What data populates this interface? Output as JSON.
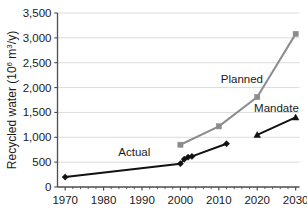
{
  "chart_data": {
    "type": "line",
    "title": "",
    "xlabel": "",
    "ylabel": "Recycled water (10⁶ m³/y)",
    "ylabel_main": "Recycled water (10",
    "ylabel_exp1": "6",
    "ylabel_mid": " m",
    "ylabel_exp2": "3",
    "ylabel_tail": "/y)",
    "xlim": [
      1968,
      2031
    ],
    "ylim": [
      0,
      3500
    ],
    "grid": true,
    "grid_axis": "y",
    "legend_position": "inline-annotations",
    "x_ticks": [
      1970,
      1980,
      1990,
      2000,
      2010,
      2020,
      2030
    ],
    "x_tick_labels": [
      "1970",
      "1980",
      "1990",
      "2000",
      "2010",
      "2020",
      "2030"
    ],
    "x_minor_tick_interval": 2,
    "y_ticks": [
      0,
      500,
      1000,
      1500,
      2000,
      2500,
      3000,
      3500
    ],
    "y_tick_labels": [
      "0",
      "500",
      "1,000",
      "1,500",
      "2,000",
      "2,500",
      "3,000",
      "3,500"
    ],
    "series": [
      {
        "name": "Actual",
        "color": "#111111",
        "marker": "diamond",
        "line_width": 2.0,
        "points": [
          {
            "x": 1970,
            "y": 200
          },
          {
            "x": 2000,
            "y": 470
          },
          {
            "x": 2001,
            "y": 560
          },
          {
            "x": 2002,
            "y": 600
          },
          {
            "x": 2003,
            "y": 615
          },
          {
            "x": 2012,
            "y": 870
          }
        ]
      },
      {
        "name": "Planned",
        "color": "#8c8c8c",
        "marker": "square",
        "line_width": 2.0,
        "points": [
          {
            "x": 2000,
            "y": 850
          },
          {
            "x": 2010,
            "y": 1220
          },
          {
            "x": 2020,
            "y": 1810
          },
          {
            "x": 2030,
            "y": 3080
          }
        ]
      },
      {
        "name": "Mandate",
        "color": "#111111",
        "marker": "triangle",
        "line_width": 2.0,
        "points": [
          {
            "x": 2020,
            "y": 1050
          },
          {
            "x": 2030,
            "y": 1400
          }
        ]
      }
    ],
    "annotations": [
      {
        "text": "Actual",
        "x": 1988,
        "y": 700,
        "name": "actual"
      },
      {
        "text": "Planned",
        "x": 2016,
        "y": 2180,
        "name": "planned"
      },
      {
        "text": "Mandate",
        "x": 2025,
        "y": 1580,
        "name": "mandate"
      }
    ]
  }
}
